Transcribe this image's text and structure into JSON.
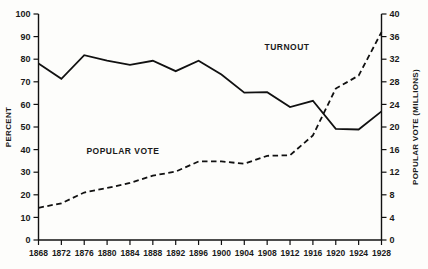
{
  "chart_data": {
    "type": "line",
    "title": "",
    "xlabel": "",
    "ylabel": "PERCENT",
    "y2label": "POPULAR VOTE (MILLIONS)",
    "grid": false,
    "legend": "inline-annotations",
    "x": [
      1868,
      1872,
      1876,
      1880,
      1884,
      1888,
      1892,
      1896,
      1900,
      1904,
      1908,
      1912,
      1916,
      1920,
      1924,
      1928
    ],
    "categories": [
      "1868",
      "1872",
      "1876",
      "1880",
      "1884",
      "1888",
      "1892",
      "1896",
      "1900",
      "1904",
      "1908",
      "1912",
      "1916",
      "1920",
      "1924",
      "1928"
    ],
    "ylim": [
      0,
      100
    ],
    "yticks": [
      0,
      10,
      20,
      30,
      40,
      50,
      60,
      70,
      80,
      90,
      100
    ],
    "y2lim": [
      0,
      40
    ],
    "y2ticks": [
      0,
      4,
      8,
      12,
      16,
      20,
      24,
      28,
      32,
      36,
      40
    ],
    "series": [
      {
        "name": "TURNOUT",
        "axis": "left",
        "style": "solid",
        "units": "percent",
        "values": [
          78.1,
          71.3,
          81.8,
          79.4,
          77.5,
          79.3,
          74.7,
          79.3,
          73.2,
          65.2,
          65.4,
          58.8,
          61.6,
          49.2,
          48.9,
          56.9
        ],
        "label_x": 1912,
        "label_y": 84
      },
      {
        "name": "POPULAR VOTE",
        "axis": "right",
        "style": "dashed",
        "units": "millions",
        "values": [
          5.7,
          6.5,
          8.4,
          9.2,
          10.1,
          11.4,
          12.1,
          13.9,
          13.9,
          13.5,
          14.9,
          15.0,
          18.5,
          26.8,
          29.1,
          36.8
        ],
        "label_x": 1884,
        "label_y_percent": 38
      }
    ]
  },
  "axes": {
    "left_title": "PERCENT",
    "right_title": "POPULAR VOTE (MILLIONS)",
    "left_ticks": [
      "0",
      "10",
      "20",
      "30",
      "40",
      "50",
      "60",
      "70",
      "80",
      "90",
      "100"
    ],
    "right_ticks": [
      "0",
      "4",
      "8",
      "12",
      "16",
      "20",
      "24",
      "28",
      "32",
      "36",
      "40"
    ],
    "x_ticks": [
      "1868",
      "1872",
      "1876",
      "1880",
      "1884",
      "1888",
      "1892",
      "1896",
      "1900",
      "1904",
      "1908",
      "1912",
      "1916",
      "1920",
      "1924",
      "1928"
    ]
  },
  "annotations": {
    "turnout_label": "TURNOUT",
    "popular_vote_label": "POPULAR VOTE"
  }
}
